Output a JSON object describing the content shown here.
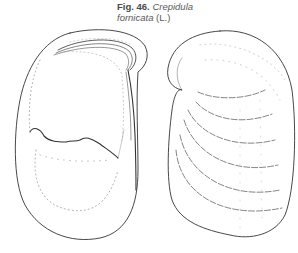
{
  "figure": {
    "number_label": "Fig. 46.",
    "species_genus": "Crepidula",
    "species_epithet": "fornicata",
    "authority": "(L.)",
    "views": [
      {
        "name": "ventral-view",
        "description": "shell interior with septum"
      },
      {
        "name": "dorsal-view",
        "description": "shell exterior with growth lines"
      }
    ],
    "line_color": "#333333",
    "stipple_color": "#8a8a8a"
  }
}
